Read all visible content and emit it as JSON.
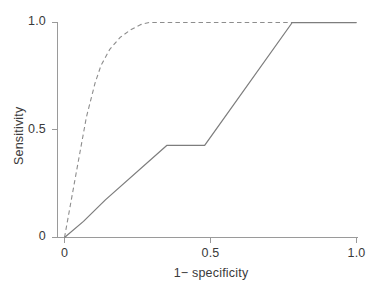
{
  "chart_data": {
    "type": "line",
    "title": "",
    "xlabel": "1− specificity",
    "ylabel": "Sensitivity",
    "xlim": [
      0,
      1
    ],
    "ylim": [
      0,
      1
    ],
    "grid": false,
    "legend": "none",
    "xticks": [
      {
        "value": 0,
        "label": "0"
      },
      {
        "value": 0.5,
        "label": "0.5"
      },
      {
        "value": 1.0,
        "label": "1.0"
      }
    ],
    "yticks": [
      {
        "value": 0,
        "label": "0"
      },
      {
        "value": 0.5,
        "label": "0.5"
      },
      {
        "value": 1.0,
        "label": "1.0"
      }
    ],
    "series": [
      {
        "name": "roc-solid",
        "style": "solid",
        "color": "#7d7d7d",
        "x": [
          0.0,
          0.065,
          0.14,
          0.35,
          0.48,
          0.78,
          1.0
        ],
        "y": [
          0.0,
          0.075,
          0.175,
          0.428,
          0.428,
          1.0,
          1.0
        ]
      },
      {
        "name": "roc-dashed",
        "style": "dashed",
        "color": "#8d8d8d",
        "x": [
          0.0,
          0.04,
          0.075,
          0.105,
          0.125,
          0.155,
          0.19,
          0.225,
          0.26,
          0.29,
          1.0
        ],
        "y": [
          0.0,
          0.3,
          0.56,
          0.72,
          0.8,
          0.875,
          0.93,
          0.965,
          0.99,
          1.0,
          1.0
        ]
      }
    ]
  },
  "axes": {
    "x_label": "1− specificity",
    "y_label": "Sensitivity",
    "x_tick_labels": [
      "0",
      "0.5",
      "1.0"
    ],
    "y_tick_labels": [
      "0",
      "0.5",
      "1.0"
    ],
    "axis_color": "#9a9a9a"
  },
  "colors": {
    "background": "#ffffff",
    "axis": "#9a9a9a",
    "text": "#3a3a3a",
    "solid_line": "#7d7d7d",
    "dashed_line": "#8d8d8d"
  }
}
